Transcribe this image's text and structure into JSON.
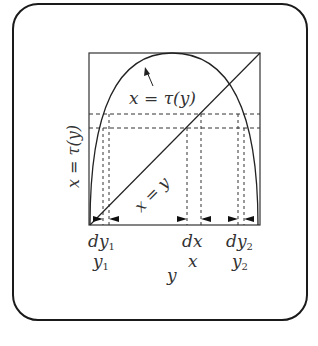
{
  "figure": {
    "curve_label": "x = τ(y)",
    "diagonal_label": "x = y",
    "vertical_axis_label": "x = τ(y)",
    "horizontal_axis_label": "y",
    "interval_labels": [
      {
        "diff": "dy",
        "diff_sub": "1",
        "point": "y",
        "point_sub": "1"
      },
      {
        "diff": "dx",
        "diff_sub": "",
        "point": "x",
        "point_sub": ""
      },
      {
        "diff": "dy",
        "diff_sub": "2",
        "point": "y",
        "point_sub": "2"
      }
    ]
  },
  "caption": {
    "text": ""
  }
}
